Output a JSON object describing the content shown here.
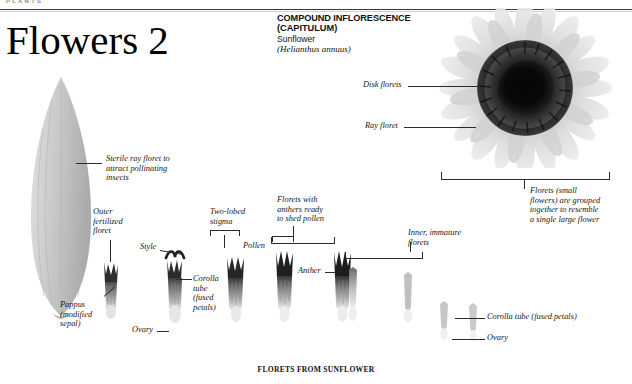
{
  "page": {
    "kicker": "PLANTS",
    "title": "Flowers 2",
    "bottom_caption": "FLORETS FROM SUNFLOWER"
  },
  "heading": {
    "line1": "COMPOUND INFLORESCENCE",
    "line2": "(CAPITULUM)",
    "common_name": "Sunflower",
    "scientific_name": "(Helianthus annuus)"
  },
  "labels": {
    "disk_florets": "Disk florets",
    "ray_floret": "Ray floret",
    "head_caption": "Florets (small\nflowers) are grouped\ntogether to resemble\na single large flower",
    "sterile_ray": "Sterile ray floret to\nattract pollinating\ninsects",
    "outer_fertilized": "Outer\nfertilized\nfloret",
    "two_lobed_stigma": "Two-lobed\nstigma",
    "style": "Style",
    "pollen": "Pollen",
    "anthers_ready": "Florets with\nanthers ready\nto shed pollen",
    "anther": "Anther",
    "inner_immature": "Inner, immature\nflorets",
    "pappus": "Pappus\n(modified\nsepal)",
    "corolla_tube_left": "Corolla\ntube\n(fused\npetals)",
    "ovary_left": "Ovary",
    "corolla_tube_right": "Corolla tube (fused petals)",
    "ovary_right": "Ovary"
  },
  "colors": {
    "ink": "#161616",
    "rule": "#3a3a3a",
    "kicker": "#8d8d8d",
    "disk_dark": "#1a1a1a",
    "disk_mid": "#3d3d3d",
    "ray_light": "#d9d9d9",
    "petal_grey": "#c9c9c9",
    "specimen_grey": "#9a9a9a",
    "background": "#ffffff"
  }
}
